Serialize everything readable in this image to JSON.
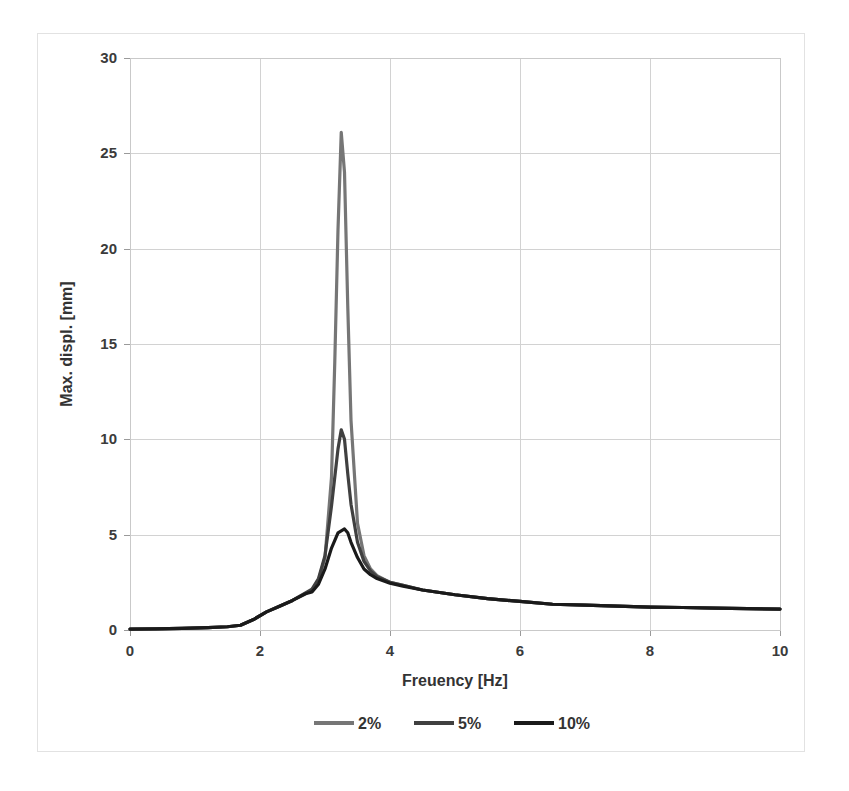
{
  "chart_data": {
    "type": "line",
    "title": "",
    "xlabel": "Freuency [Hz]",
    "ylabel": "Max. displ. [mm]",
    "xlim": [
      0,
      10
    ],
    "ylim": [
      0,
      30
    ],
    "xticks": [
      0,
      2,
      4,
      6,
      8,
      10
    ],
    "yticks": [
      0,
      5,
      10,
      15,
      20,
      25,
      30
    ],
    "xtick_labels": [
      "0",
      "2",
      "4",
      "6",
      "8",
      "10"
    ],
    "ytick_labels": [
      "0",
      "5",
      "10",
      "15",
      "20",
      "25",
      "30"
    ],
    "grid": true,
    "legend_position": "bottom",
    "series": [
      {
        "name": "2%",
        "color": "#767676",
        "x": [
          0.0,
          0.4,
          0.8,
          1.2,
          1.5,
          1.7,
          1.9,
          2.1,
          2.3,
          2.5,
          2.7,
          2.8,
          2.9,
          3.0,
          3.1,
          3.15,
          3.2,
          3.25,
          3.3,
          3.35,
          3.4,
          3.5,
          3.6,
          3.7,
          3.8,
          4.0,
          4.2,
          4.5,
          5.0,
          5.5,
          6.0,
          6.5,
          7.0,
          7.5,
          8.0,
          8.5,
          9.0,
          9.5,
          10.0
        ],
        "y": [
          0.05,
          0.06,
          0.08,
          0.12,
          0.17,
          0.25,
          0.55,
          0.95,
          1.25,
          1.55,
          1.9,
          2.1,
          2.6,
          3.8,
          8.0,
          14.0,
          21.0,
          26.1,
          24.0,
          17.0,
          11.0,
          5.6,
          3.9,
          3.2,
          2.85,
          2.5,
          2.35,
          2.1,
          1.85,
          1.65,
          1.5,
          1.35,
          1.3,
          1.25,
          1.2,
          1.18,
          1.15,
          1.12,
          1.1
        ]
      },
      {
        "name": "5%",
        "color": "#404040",
        "x": [
          0.0,
          0.4,
          0.8,
          1.2,
          1.5,
          1.7,
          1.9,
          2.1,
          2.3,
          2.5,
          2.7,
          2.8,
          2.9,
          3.0,
          3.1,
          3.2,
          3.25,
          3.3,
          3.35,
          3.4,
          3.5,
          3.6,
          3.7,
          3.8,
          4.0,
          4.2,
          4.5,
          5.0,
          5.5,
          6.0,
          6.5,
          7.0,
          7.5,
          8.0,
          8.5,
          9.0,
          9.5,
          10.0
        ],
        "y": [
          0.05,
          0.06,
          0.08,
          0.12,
          0.17,
          0.25,
          0.55,
          0.95,
          1.25,
          1.55,
          1.95,
          2.15,
          2.7,
          3.9,
          6.5,
          9.5,
          10.5,
          10.0,
          8.2,
          6.6,
          4.6,
          3.6,
          3.1,
          2.8,
          2.5,
          2.35,
          2.1,
          1.85,
          1.65,
          1.5,
          1.35,
          1.3,
          1.25,
          1.2,
          1.18,
          1.15,
          1.12,
          1.1
        ]
      },
      {
        "name": "10%",
        "color": "#1a1a1a",
        "x": [
          0.0,
          0.4,
          0.8,
          1.2,
          1.5,
          1.7,
          1.9,
          2.1,
          2.3,
          2.5,
          2.7,
          2.8,
          2.9,
          3.0,
          3.1,
          3.2,
          3.3,
          3.35,
          3.4,
          3.5,
          3.6,
          3.7,
          3.8,
          4.0,
          4.2,
          4.5,
          5.0,
          5.5,
          6.0,
          6.5,
          7.0,
          7.5,
          8.0,
          8.5,
          9.0,
          9.5,
          10.0
        ],
        "y": [
          0.05,
          0.06,
          0.08,
          0.12,
          0.17,
          0.25,
          0.55,
          0.95,
          1.25,
          1.55,
          1.9,
          2.0,
          2.4,
          3.2,
          4.3,
          5.1,
          5.3,
          5.1,
          4.6,
          3.8,
          3.2,
          2.9,
          2.7,
          2.45,
          2.3,
          2.1,
          1.85,
          1.65,
          1.5,
          1.35,
          1.3,
          1.25,
          1.2,
          1.18,
          1.15,
          1.12,
          1.1
        ]
      }
    ]
  },
  "legend": {
    "items": [
      {
        "label": "2%",
        "color": "#767676"
      },
      {
        "label": "5%",
        "color": "#404040"
      },
      {
        "label": "10%",
        "color": "#1a1a1a"
      }
    ]
  },
  "axes": {
    "x_title": "Freuency [Hz]",
    "y_title": "Max. displ. [mm]"
  }
}
